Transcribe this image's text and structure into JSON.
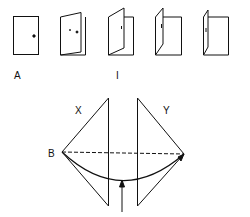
{
  "labels": {
    "door_a": "A",
    "door_i": "I",
    "x": "X",
    "y": "Y",
    "b": "B"
  },
  "doors": [
    {
      "name": "door-closed",
      "state": "closed"
    },
    {
      "name": "door-slightly-open",
      "state": "slightly-open"
    },
    {
      "name": "door-half-open",
      "state": "half-open"
    },
    {
      "name": "door-mostly-open",
      "state": "mostly-open"
    },
    {
      "name": "door-fully-open",
      "state": "fully-open"
    }
  ],
  "colors": {
    "stroke": "#111111",
    "background": "#ffffff"
  }
}
